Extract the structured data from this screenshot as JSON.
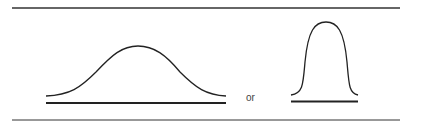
{
  "figure": {
    "connector_text": "or",
    "colors": {
      "stroke": "#222222",
      "rule": "#333333",
      "text": "#444444"
    },
    "curves": [
      {
        "name": "wide-bell-curve",
        "description": "broad, flat normal distribution"
      },
      {
        "name": "narrow-bell-curve",
        "description": "tall, narrow normal distribution"
      }
    ]
  }
}
